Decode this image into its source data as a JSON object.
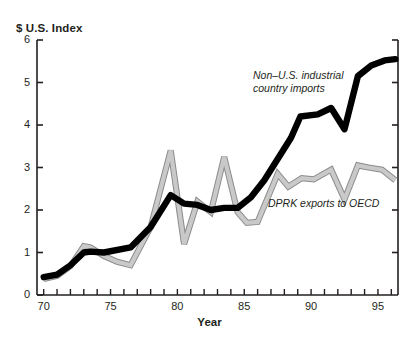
{
  "chart_data": {
    "type": "line",
    "title": "",
    "subtitle": "",
    "xlabel": "Year",
    "ylabel": "$ U.S. Index",
    "xlim": [
      69.5,
      96.5
    ],
    "ylim": [
      0,
      6
    ],
    "xticks": [
      70,
      71,
      72,
      73,
      74,
      75,
      76,
      77,
      78,
      79,
      80,
      81,
      82,
      83,
      84,
      85,
      86,
      87,
      88,
      89,
      90,
      91,
      92,
      93,
      94,
      95,
      96
    ],
    "xtick_labels": [
      "70",
      "",
      "",
      "",
      "",
      "75",
      "",
      "",
      "",
      "",
      "80",
      "",
      "",
      "",
      "",
      "85",
      "",
      "",
      "",
      "",
      "90",
      "",
      "",
      "",
      "",
      "95",
      ""
    ],
    "yticks": [
      0,
      1,
      2,
      3,
      4,
      5,
      6
    ],
    "ytick_labels": [
      "0",
      "1",
      "2",
      "3",
      "4",
      "5",
      "6"
    ],
    "grid": false,
    "legend": "inline-annotations",
    "series": [
      {
        "name": "Non-U.S. industrial country imports",
        "color": "#000000",
        "style": "thick-solid",
        "annotation": "Non–U.S. industrial\ncountry imports",
        "x": [
          70,
          71,
          72,
          73,
          73.5,
          74.5,
          76.5,
          78,
          79.5,
          80.5,
          81.5,
          82.5,
          83.5,
          84.5,
          85.5,
          86.5,
          87.5,
          88.5,
          89.2,
          90.5,
          91.5,
          92.5,
          93.5,
          94.5,
          95.5,
          96.3
        ],
        "values": [
          0.42,
          0.48,
          0.7,
          1.0,
          1.02,
          1.0,
          1.12,
          1.6,
          2.35,
          2.15,
          2.12,
          2.0,
          2.05,
          2.05,
          2.3,
          2.7,
          3.2,
          3.7,
          4.2,
          4.25,
          4.4,
          3.9,
          5.15,
          5.4,
          5.52,
          5.55
        ]
      },
      {
        "name": "DPRK exports to OECD",
        "color": "#c9c9c9",
        "style": "thin-outlined",
        "annotation": "DPRK exports to OECD",
        "x": [
          70,
          71,
          72,
          73,
          73.5,
          74.5,
          75.5,
          76.5,
          78,
          79.5,
          80.5,
          81.5,
          82.5,
          83.5,
          84.5,
          85.2,
          86,
          87.5,
          88.3,
          89.3,
          90.2,
          91.5,
          92.5,
          93.5,
          94.3,
          95.3,
          96.3
        ],
        "values": [
          0.38,
          0.45,
          0.68,
          1.15,
          1.12,
          0.92,
          0.78,
          0.7,
          1.6,
          3.4,
          1.2,
          2.2,
          1.95,
          3.25,
          1.95,
          1.7,
          1.72,
          2.85,
          2.55,
          2.75,
          2.72,
          2.95,
          2.25,
          3.05,
          3.0,
          2.95,
          2.7
        ]
      }
    ]
  },
  "axes": {
    "y_title": "$ U.S. Index",
    "x_title": "Year",
    "y_labels": [
      "6",
      "5",
      "4",
      "3",
      "2",
      "1",
      "0"
    ],
    "x_labels": [
      "70",
      "75",
      "80",
      "85",
      "90",
      "95"
    ]
  },
  "annotations": {
    "black_series_line1": "Non–U.S. industrial",
    "black_series_line2": "country imports",
    "gray_series": "DPRK exports to OECD"
  },
  "colors": {
    "black_series": "#000000",
    "gray_series_fill": "#c9c9c9",
    "gray_series_stroke": "#8c8c8c",
    "axis": "#231f20",
    "background": "#ffffff"
  }
}
